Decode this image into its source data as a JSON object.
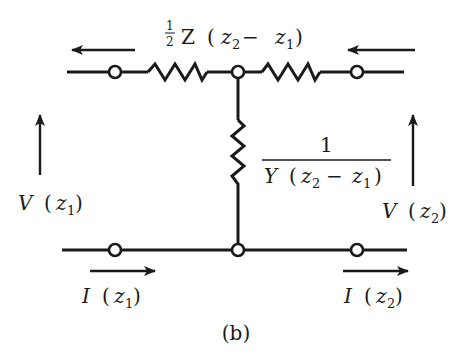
{
  "figure": {
    "caption": "(b)",
    "type": "T-network equivalent circuit"
  },
  "labels": {
    "series_impedance": {
      "frac_num": "1",
      "frac_den": "2",
      "symbol": "Z",
      "arg_open": "(",
      "z2": "z",
      "z2_sub": "2",
      "minus": "−",
      "z1": "z",
      "z1_sub": "1",
      "arg_close": ")"
    },
    "shunt_impedance": {
      "numerator": "1",
      "den_symbol": "Y",
      "den_arg_open": "(",
      "den_z2": "z",
      "den_z2_sub": "2",
      "den_minus": "−",
      "den_z1": "z",
      "den_z1_sub": "1",
      "den_arg_close": ")"
    },
    "v_left": {
      "symbol": "V",
      "open": "(",
      "var": "z",
      "sub": "1",
      "close": ")"
    },
    "v_right": {
      "symbol": "V",
      "open": "(",
      "var": "z",
      "sub": "2",
      "close": ")"
    },
    "i_left": {
      "symbol": "I",
      "open": "(",
      "var": "z",
      "sub": "1",
      "close": ")"
    },
    "i_right": {
      "symbol": "I",
      "open": "(",
      "var": "z",
      "sub": "2",
      "close": ")"
    }
  },
  "colors": {
    "stroke": "#1a1a1a",
    "background": "#ffffff"
  }
}
